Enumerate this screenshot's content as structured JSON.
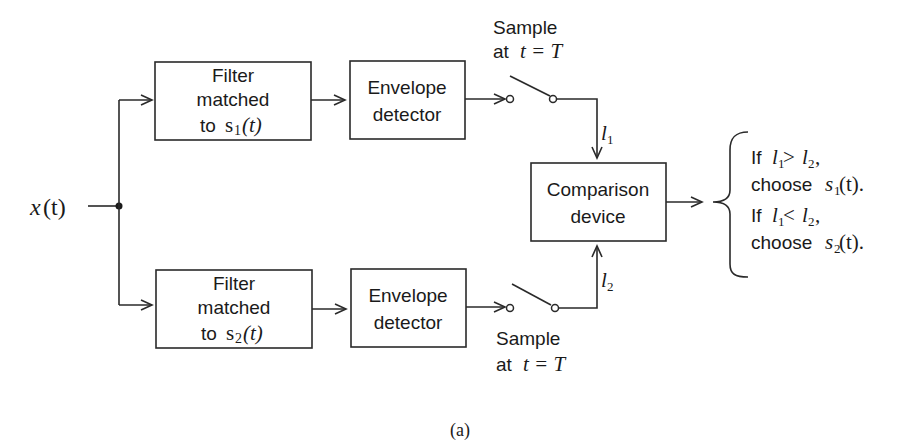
{
  "diagram": {
    "input": {
      "label": "x",
      "arg": "(t)"
    },
    "top_branch": {
      "filter": {
        "line1": "Filter",
        "line2": "matched",
        "line3_prefix": "to ",
        "signal": "s",
        "sub": "1",
        "arg": "(t)"
      },
      "envelope": {
        "line1": "Envelope",
        "line2": "detector"
      },
      "sample": {
        "line1": "Sample",
        "line2_prefix": "at ",
        "eq": "t = T"
      },
      "output_label": {
        "var": "l",
        "sub": "1"
      }
    },
    "bottom_branch": {
      "filter": {
        "line1": "Filter",
        "line2": "matched",
        "line3_prefix": "to ",
        "signal": "s",
        "sub": "2",
        "arg": "(t)"
      },
      "envelope": {
        "line1": "Envelope",
        "line2": "detector"
      },
      "sample": {
        "line1": "Sample",
        "line2_prefix": "at ",
        "eq": "t = T"
      },
      "output_label": {
        "var": "l",
        "sub": "2"
      }
    },
    "comparison": {
      "line1": "Comparison",
      "line2": "device"
    },
    "decisions": [
      {
        "cond_prefix": "If ",
        "lhs": "l",
        "lhs_sub": "1",
        "op": " > ",
        "rhs": "l",
        "rhs_sub": "2",
        "tail": ",",
        "action_prefix": "choose ",
        "signal": "s",
        "signal_sub": "1",
        "arg": " (t)."
      },
      {
        "cond_prefix": "If ",
        "lhs": "l",
        "lhs_sub": "1",
        "op": " < ",
        "rhs": "l",
        "rhs_sub": "2",
        "tail": ",",
        "action_prefix": "choose ",
        "signal": "s",
        "signal_sub": "2",
        "arg": " (t)."
      }
    ],
    "caption": "(a)"
  }
}
